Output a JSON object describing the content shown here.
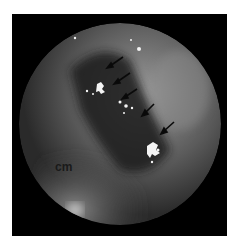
{
  "image": {
    "description": "Grayscale circular endoscopic view with bright reflective deposits indicated by arrows",
    "label": "cm",
    "arrow_count": 5,
    "colors": {
      "frame": "#000000",
      "background": "#ffffff",
      "arrow": "#0a0a0a",
      "highlight": "#f4f4f4"
    }
  }
}
